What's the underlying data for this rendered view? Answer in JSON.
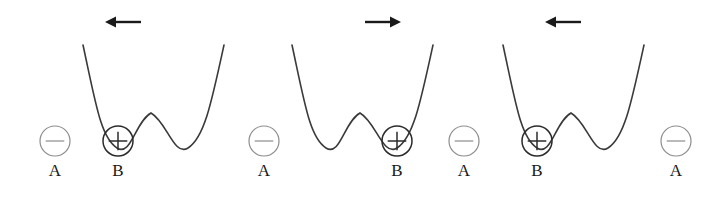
{
  "figure": {
    "width": 720,
    "height": 199,
    "background": "#ffffff",
    "curve_color": "#3a3a3a",
    "arrow_color": "#1a1a1a",
    "negative_circle_color": "#8c8c8c",
    "positive_circle_color": "#2b2b2b",
    "label_color": "#1a1a1a"
  },
  "arrows": [
    {
      "name": "arrow-panel-1",
      "direction": "left",
      "glyph": "←",
      "x": 105,
      "y": 10,
      "length": 36
    },
    {
      "name": "arrow-panel-2",
      "direction": "right",
      "glyph": "→",
      "x": 365,
      "y": 10,
      "length": 36
    },
    {
      "name": "arrow-panel-3",
      "direction": "left",
      "glyph": "←",
      "x": 545,
      "y": 10,
      "length": 36
    }
  ],
  "wells": [
    {
      "name": "double-well-1",
      "left_edge": 83,
      "right_edge": 224,
      "top_y": 45,
      "valley_y": 148,
      "barrier_y": 113,
      "barrier_x": 151,
      "left_valley_x": 117,
      "right_valley_x": 188,
      "occupied_side": "left"
    },
    {
      "name": "double-well-2",
      "left_edge": 292,
      "right_edge": 433,
      "top_y": 45,
      "valley_y": 148,
      "barrier_y": 113,
      "barrier_x": 360,
      "left_valley_x": 326,
      "right_valley_x": 397,
      "occupied_side": "right"
    },
    {
      "name": "double-well-3",
      "left_edge": 503,
      "right_edge": 644,
      "top_y": 45,
      "valley_y": 148,
      "barrier_y": 113,
      "barrier_x": 571,
      "left_valley_x": 537,
      "right_valley_x": 608,
      "occupied_side": "left"
    }
  ],
  "charges": [
    {
      "name": "charge-a-1",
      "sign": "−",
      "label": "A",
      "type": "negative",
      "cx": 55,
      "cy": 141,
      "r": 15
    },
    {
      "name": "charge-b-1",
      "sign": "+",
      "label": "B",
      "type": "positive",
      "cx": 118,
      "cy": 141,
      "r": 15
    },
    {
      "name": "charge-a-2",
      "sign": "−",
      "label": "A",
      "type": "negative",
      "cx": 264,
      "cy": 141,
      "r": 15
    },
    {
      "name": "charge-b-2",
      "sign": "+",
      "label": "B",
      "type": "positive",
      "cx": 397,
      "cy": 141,
      "r": 15
    },
    {
      "name": "charge-a-3",
      "sign": "−",
      "label": "A",
      "type": "negative",
      "cx": 464,
      "cy": 141,
      "r": 15
    },
    {
      "name": "charge-b-3",
      "sign": "+",
      "label": "B",
      "type": "positive",
      "cx": 537,
      "cy": 141,
      "r": 15
    },
    {
      "name": "charge-a-4",
      "sign": "−",
      "label": "A",
      "type": "negative",
      "cx": 676,
      "cy": 141,
      "r": 15
    }
  ],
  "labels": [
    {
      "name": "label-a-1",
      "text": "A",
      "x": 55,
      "y": 170
    },
    {
      "name": "label-b-1",
      "text": "B",
      "x": 118,
      "y": 170
    },
    {
      "name": "label-a-2",
      "text": "A",
      "x": 264,
      "y": 170
    },
    {
      "name": "label-b-2",
      "text": "B",
      "x": 397,
      "y": 170
    },
    {
      "name": "label-a-3",
      "text": "A",
      "x": 464,
      "y": 170
    },
    {
      "name": "label-b-3",
      "text": "B",
      "x": 537,
      "y": 170
    },
    {
      "name": "label-a-4",
      "text": "A",
      "x": 676,
      "y": 170
    }
  ]
}
